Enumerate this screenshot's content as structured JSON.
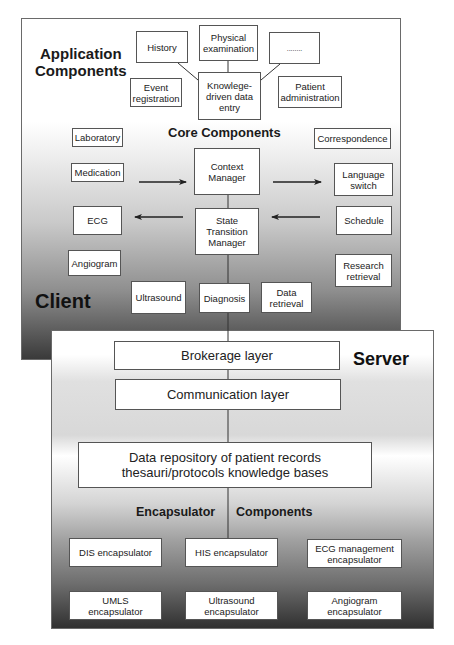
{
  "client": {
    "label": "Client",
    "application_heading": "Application Components",
    "application_heading_line1": "Application",
    "application_heading_line2": "Components",
    "application_boxes": {
      "history": "History",
      "physical_examination": "Physical examination",
      "ellipsis": "........",
      "event_registration": "Event registration",
      "knowledge_driven_data_entry": "Knowlege-driven data entry",
      "patient_administration": "Patient administration"
    },
    "core_heading": "Core Components",
    "core_boxes": {
      "context_manager": "Context Manager",
      "state_transition_manager": "State Transition Manager"
    },
    "left_boxes": {
      "laboratory": "Laboratory",
      "medication": "Medication",
      "ecg": "ECG",
      "angiogram": "Angiogram",
      "ultrasound": "Ultrasound"
    },
    "bottom_boxes": {
      "diagnosis": "Diagnosis",
      "data_retrieval": "Data retrieval"
    },
    "right_boxes": {
      "correspondence": "Correspondence",
      "language_switch": "Language switch",
      "schedule": "Schedule",
      "research_retrieval": "Research retrieval"
    }
  },
  "server": {
    "label": "Server",
    "layers": {
      "brokerage": "Brokerage layer",
      "communication": "Communication layer",
      "repository_line1": "Data repository of patient records",
      "repository_line2": "thesauri/protocols knowledge bases"
    },
    "encapsulator_heading_left": "Encapsulator",
    "encapsulator_heading_right": "Components",
    "encapsulators": {
      "dis": "DIS encapsulator",
      "his": "HIS encapsulator",
      "ecg_management": "ECG management encapsulator",
      "umls": "UMLS encapsulator",
      "ultrasound": "Ultrasound encapsulator",
      "angiogram": "Angiogram encapsulator"
    }
  },
  "colors": {
    "border": "#555555",
    "text": "#1a1a1a",
    "gradient_dark": "#303030",
    "box_fill": "#ffffff"
  }
}
